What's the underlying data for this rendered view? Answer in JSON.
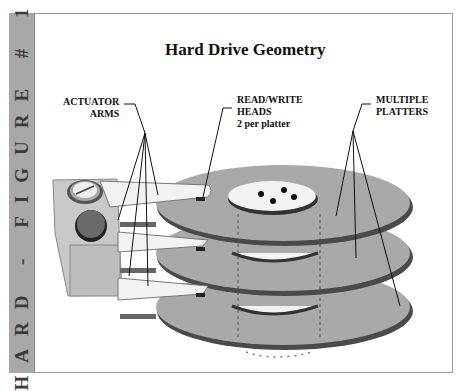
{
  "figure": {
    "side_label": "HARD - FIGURE # 1",
    "title": "Hard Drive Geometry"
  },
  "labels": {
    "actuator_arms": [
      "ACTUATOR",
      "ARMS"
    ],
    "read_write_heads": [
      "READ/WRITE",
      "HEADS",
      "2 per platter"
    ],
    "multiple_platters": [
      "MULTIPLE",
      "PLATTERS"
    ]
  },
  "colors": {
    "strip": "#a8a8a8",
    "platter": "#a9a9a9",
    "platter_edge": "#4a4a4a",
    "arm": "#f2f2f2",
    "actuator_block": "#c8c8c8"
  }
}
